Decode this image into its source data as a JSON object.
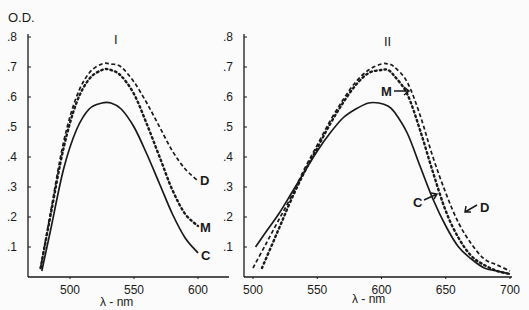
{
  "ylabel": "O.D.",
  "chart_data": [
    {
      "type": "line",
      "title": "I",
      "xlabel": "λ - nm",
      "ylabel": "O.D.",
      "xticks": [
        500,
        550,
        600
      ],
      "yticks": [
        ".1",
        ".2",
        ".3",
        ".4",
        ".5",
        ".6",
        ".7",
        ".8"
      ],
      "xlim": [
        468,
        625
      ],
      "ylim": [
        0,
        0.8
      ],
      "grid": false,
      "series": [
        {
          "name": "D",
          "style": "dashed",
          "x": [
            477,
            485,
            495,
            505,
            515,
            525,
            532,
            540,
            550,
            560,
            570,
            580,
            590,
            600
          ],
          "y": [
            0.03,
            0.22,
            0.45,
            0.6,
            0.68,
            0.71,
            0.71,
            0.7,
            0.65,
            0.58,
            0.5,
            0.42,
            0.36,
            0.32
          ]
        },
        {
          "name": "M",
          "style": "dotted",
          "x": [
            477,
            485,
            495,
            505,
            515,
            525,
            532,
            540,
            550,
            560,
            570,
            580,
            590,
            600
          ],
          "y": [
            0.03,
            0.21,
            0.43,
            0.58,
            0.66,
            0.69,
            0.69,
            0.67,
            0.61,
            0.51,
            0.4,
            0.29,
            0.21,
            0.17
          ]
        },
        {
          "name": "C",
          "style": "solid",
          "x": [
            478,
            485,
            495,
            505,
            515,
            525,
            532,
            540,
            550,
            560,
            570,
            580,
            590,
            600
          ],
          "y": [
            0.02,
            0.16,
            0.36,
            0.49,
            0.56,
            0.58,
            0.58,
            0.56,
            0.5,
            0.41,
            0.31,
            0.21,
            0.13,
            0.08
          ]
        }
      ],
      "annotations": [
        "D",
        "M",
        "C"
      ]
    },
    {
      "type": "line",
      "title": "II",
      "xlabel": "λ - nm",
      "ylabel": "",
      "xticks": [
        500,
        550,
        600,
        650,
        700
      ],
      "yticks": [
        ".1",
        ".2",
        ".3",
        ".4",
        ".5",
        ".6",
        ".7",
        ".8"
      ],
      "xlim": [
        493,
        702
      ],
      "ylim": [
        0,
        0.8
      ],
      "grid": false,
      "series": [
        {
          "name": "D",
          "style": "dashed",
          "x": [
            500,
            510,
            520,
            530,
            540,
            550,
            560,
            570,
            580,
            590,
            600,
            605,
            610,
            620,
            630,
            640,
            650,
            660,
            670,
            680,
            690,
            700
          ],
          "y": [
            0.03,
            0.11,
            0.19,
            0.27,
            0.36,
            0.44,
            0.52,
            0.59,
            0.65,
            0.69,
            0.71,
            0.71,
            0.7,
            0.65,
            0.54,
            0.4,
            0.28,
            0.18,
            0.11,
            0.06,
            0.04,
            0.02
          ]
        },
        {
          "name": "M",
          "style": "dotted",
          "x": [
            507,
            515,
            522,
            530,
            540,
            550,
            560,
            570,
            580,
            590,
            600,
            605,
            610,
            620,
            630,
            640,
            650,
            660,
            670,
            680,
            690,
            700
          ],
          "y": [
            0.03,
            0.11,
            0.18,
            0.26,
            0.35,
            0.43,
            0.51,
            0.58,
            0.64,
            0.68,
            0.69,
            0.69,
            0.67,
            0.61,
            0.49,
            0.35,
            0.22,
            0.13,
            0.07,
            0.04,
            0.02,
            0.01
          ]
        },
        {
          "name": "C",
          "style": "solid",
          "x": [
            502,
            510,
            520,
            530,
            540,
            550,
            560,
            570,
            580,
            590,
            598,
            605,
            610,
            620,
            630,
            640,
            650,
            660,
            670,
            680,
            690,
            700
          ],
          "y": [
            0.1,
            0.15,
            0.21,
            0.28,
            0.35,
            0.42,
            0.48,
            0.53,
            0.56,
            0.58,
            0.58,
            0.57,
            0.55,
            0.48,
            0.37,
            0.26,
            0.17,
            0.1,
            0.06,
            0.03,
            0.02,
            0.01
          ]
        }
      ],
      "annotations": [
        "M",
        "C",
        "D"
      ]
    }
  ]
}
